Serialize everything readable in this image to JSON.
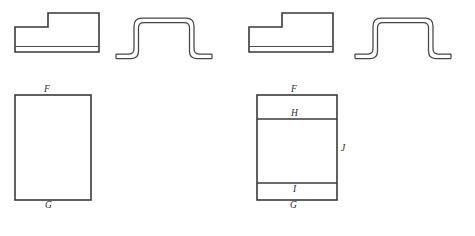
{
  "figure": {
    "background_color": "#ffffff",
    "line_color": "#3a3a3c",
    "width": 475,
    "height": 236
  },
  "groups": [
    {
      "name": "left-group",
      "stepped_profile": {
        "name": "stepped-block-left",
        "description": "stepped rectangular block cross-section with thin base strip"
      },
      "hat_profile": {
        "name": "hat-profile-left",
        "description": "formed top-hat sheet metal profile with flanges"
      },
      "plan_rectangle": {
        "name": "plan-rectangle-left",
        "divided": false,
        "labels": [
          {
            "id": "F",
            "text": "F",
            "position": "top"
          },
          {
            "id": "G",
            "text": "G",
            "position": "bottom"
          }
        ]
      }
    },
    {
      "name": "right-group",
      "stepped_profile": {
        "name": "stepped-block-right",
        "description": "stepped rectangular block cross-section with thin base strip"
      },
      "hat_profile": {
        "name": "hat-profile-right",
        "description": "formed top-hat sheet metal profile with flanges"
      },
      "plan_rectangle": {
        "name": "plan-rectangle-right",
        "divided": true,
        "labels": [
          {
            "id": "F",
            "text": "F",
            "position": "top"
          },
          {
            "id": "H",
            "text": "H",
            "position": "upper-band"
          },
          {
            "id": "J",
            "text": "J",
            "position": "right-side"
          },
          {
            "id": "I",
            "text": "I",
            "position": "lower-band"
          },
          {
            "id": "G",
            "text": "G",
            "position": "bottom"
          }
        ]
      }
    }
  ],
  "labels": {
    "left_F": "F",
    "left_G": "G",
    "right_F": "F",
    "right_H": "H",
    "right_J": "J",
    "right_I": "I",
    "right_G": "G"
  }
}
